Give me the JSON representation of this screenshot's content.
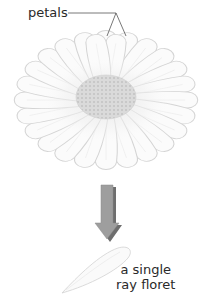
{
  "diagram": {
    "petals_label": "petals",
    "floret_label_line1": "a single",
    "floret_label_line2": "ray floret",
    "colors": {
      "petal_fill": "#fbfbfb",
      "petal_stroke": "#d6d6d6",
      "disc_fill": "#d9d9d9",
      "disc_dots": "#c4c4c4",
      "arrow_fill": "#9a9a9a",
      "arrow_shadow": "#6e6e6e",
      "leader_line": "#555555",
      "text": "#2a2a2a"
    }
  }
}
